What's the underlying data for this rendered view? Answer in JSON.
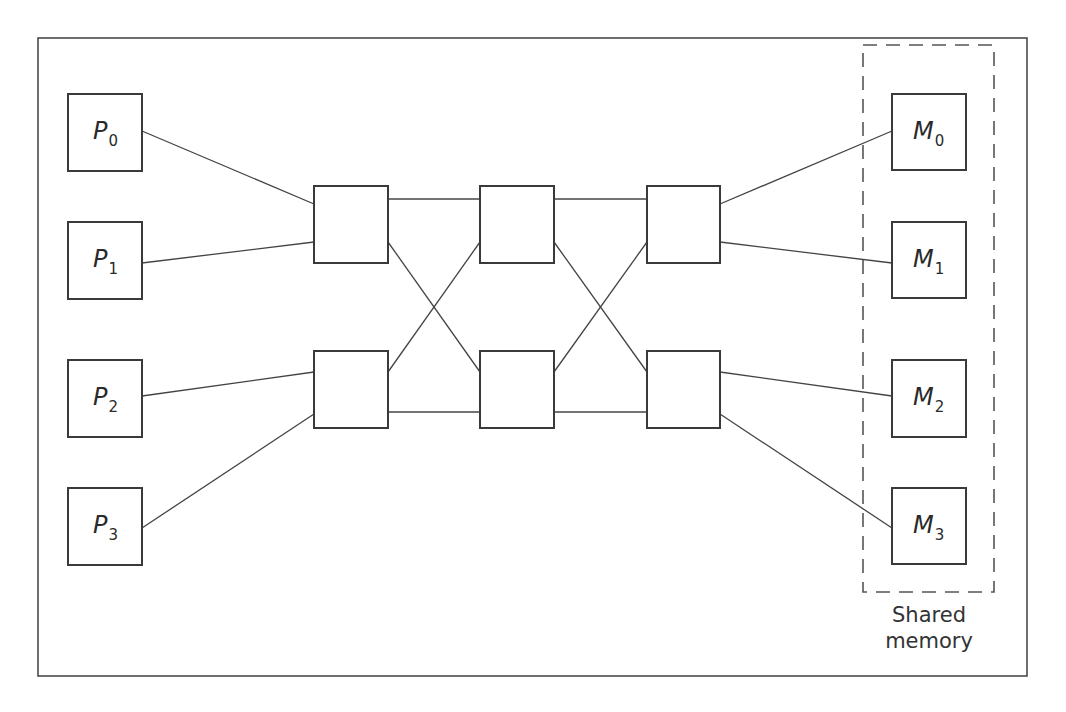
{
  "diagram": {
    "processors": [
      {
        "letter": "P",
        "index": "0"
      },
      {
        "letter": "P",
        "index": "1"
      },
      {
        "letter": "P",
        "index": "2"
      },
      {
        "letter": "P",
        "index": "3"
      }
    ],
    "memories": [
      {
        "letter": "M",
        "index": "0"
      },
      {
        "letter": "M",
        "index": "1"
      },
      {
        "letter": "M",
        "index": "2"
      },
      {
        "letter": "M",
        "index": "3"
      }
    ],
    "switch_stages": 3,
    "switches_per_stage": 2,
    "shared_memory_label": {
      "line1": "Shared",
      "line2": "memory"
    },
    "colors": {
      "stroke": "#3a3a3a",
      "background": "#ffffff"
    }
  }
}
